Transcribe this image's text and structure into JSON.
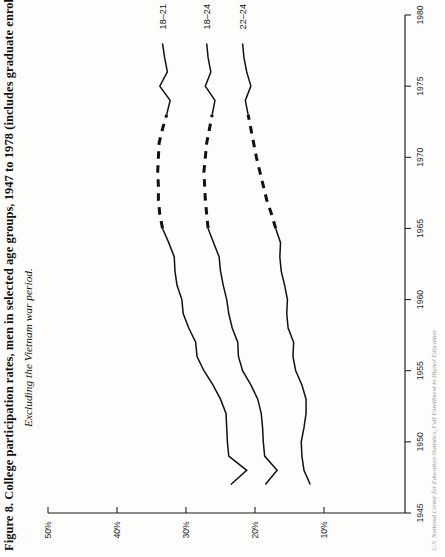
{
  "figure": {
    "title": "Figure 8. College participation rates, men in selected age groups, 1947 to 1978 (includes graduate enrollment)",
    "subtitle": "Excluding the Vietnam war period.",
    "source": "U.S. National Center for Education Statistics, Fall Enrollment in Higher Education"
  },
  "chart_data": {
    "type": "line",
    "title": "Figure 8. College participation rates, men in selected age groups, 1947 to 1978 (includes graduate enrollment)",
    "subtitle": "Excluding the Vietnam war period.",
    "orientation": "rotated-90ccw",
    "xlabel": "",
    "ylabel": "",
    "grid": false,
    "legend": "inline-end-labels",
    "x_axis": {
      "name": "year",
      "ticks": [
        1945,
        1950,
        1955,
        1960,
        1965,
        1970,
        1975,
        1980
      ],
      "tick_labels": [
        "1945",
        "1950",
        "1955",
        "1960",
        "1965",
        "1970",
        "1975",
        "1980"
      ],
      "range": [
        1945,
        1980
      ]
    },
    "y_axis": {
      "name": "participation rate",
      "ticks": [
        10,
        20,
        30,
        40,
        50
      ],
      "tick_labels": [
        "10%",
        "20%",
        "30%",
        "40%",
        "50%"
      ],
      "range": [
        0,
        50
      ],
      "unit": "%"
    },
    "excluded_period": {
      "label": "Vietnam war period",
      "start": 1966,
      "end": 1973,
      "style": "dashed"
    },
    "series": [
      {
        "name": "18-21",
        "label": "18–21",
        "x": [
          1947,
          1948,
          1949,
          1950,
          1951,
          1952,
          1953,
          1954,
          1955,
          1956,
          1957,
          1958,
          1959,
          1960,
          1961,
          1962,
          1963,
          1964,
          1965,
          1966,
          1967,
          1968,
          1969,
          1970,
          1971,
          1972,
          1973,
          1974,
          1975,
          1976,
          1977,
          1978
        ],
        "values": [
          23.5,
          21.2,
          23.8,
          24.0,
          24.1,
          24.2,
          25.0,
          26.1,
          27.4,
          28.4,
          28.6,
          29.6,
          30.4,
          30.6,
          31.3,
          31.6,
          31.7,
          32.5,
          33.4,
          33.8,
          34.0,
          34.0,
          34.1,
          34.0,
          33.9,
          33.4,
          32.8,
          32.3,
          33.8,
          32.7,
          33.1,
          33.4
        ],
        "solid_segments": [
          [
            1947,
            1965
          ],
          [
            1973,
            1978
          ]
        ],
        "dashed_segments": [
          [
            1965,
            1973
          ]
        ]
      },
      {
        "name": "18-24",
        "label": "18–24",
        "x": [
          1947,
          1948,
          1949,
          1950,
          1951,
          1952,
          1953,
          1954,
          1955,
          1956,
          1957,
          1958,
          1959,
          1960,
          1961,
          1962,
          1963,
          1964,
          1965,
          1966,
          1967,
          1968,
          1969,
          1970,
          1971,
          1972,
          1973,
          1974,
          1975,
          1976,
          1977,
          1978
        ],
        "values": [
          18.5,
          16.8,
          18.6,
          18.8,
          18.9,
          19.1,
          19.6,
          20.6,
          21.8,
          22.4,
          22.5,
          23.3,
          23.8,
          24.1,
          24.6,
          25.0,
          25.2,
          26.0,
          26.8,
          27.0,
          27.2,
          27.3,
          27.4,
          27.2,
          27.0,
          26.6,
          26.2,
          25.8,
          27.2,
          26.4,
          26.8,
          27.0
        ]
      },
      {
        "name": "22-24",
        "label": "22–24",
        "x": [
          1947,
          1948,
          1949,
          1950,
          1951,
          1952,
          1953,
          1954,
          1955,
          1956,
          1957,
          1958,
          1959,
          1960,
          1961,
          1962,
          1963,
          1964,
          1965,
          1966,
          1967,
          1968,
          1969,
          1970,
          1971,
          1972,
          1973,
          1974,
          1975,
          1976,
          1977,
          1978
        ],
        "values": [
          12.0,
          12.9,
          13.2,
          13.3,
          12.9,
          12.6,
          12.6,
          13.2,
          14.1,
          14.5,
          14.4,
          15.2,
          15.4,
          15.3,
          15.7,
          16.2,
          16.4,
          16.3,
          17.0,
          17.6,
          18.3,
          18.8,
          19.3,
          19.8,
          20.2,
          20.6,
          21.0,
          21.4,
          20.6,
          21.2,
          21.6,
          21.8
        ]
      }
    ]
  }
}
